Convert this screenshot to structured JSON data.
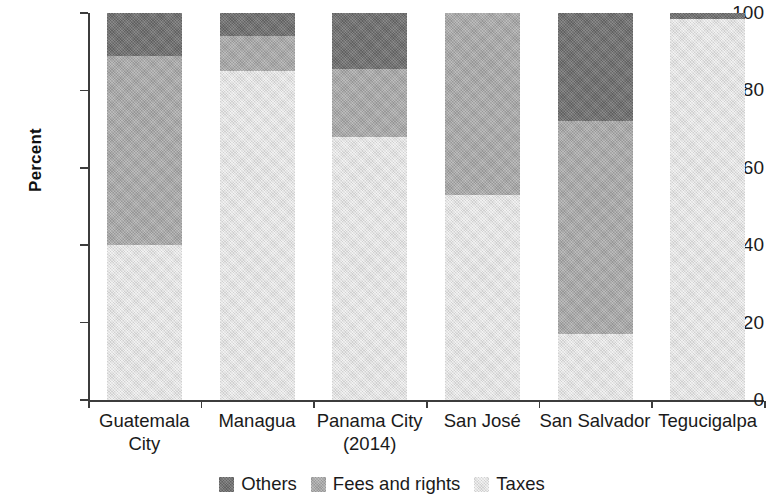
{
  "chart_data": {
    "type": "bar",
    "subtype": "stacked-bar-100-percent",
    "title": "",
    "xlabel": "",
    "ylabel": "Percent",
    "ylim": [
      0,
      100
    ],
    "yticks": [
      0,
      20,
      40,
      60,
      80,
      100
    ],
    "ytick_labels": [
      "0",
      "20",
      "40",
      "60",
      "80",
      "100"
    ],
    "grid": false,
    "legend_position": "bottom-center",
    "categories": [
      "Guatemala City",
      "Managua",
      "Panama City (2014)",
      "San José",
      "San Salvador",
      "Tegucigalpa"
    ],
    "category_lines": [
      [
        "Guatemala",
        "City"
      ],
      [
        "Managua",
        ""
      ],
      [
        "Panama City",
        "(2014)"
      ],
      [
        "San José",
        ""
      ],
      [
        "San Salvador",
        ""
      ],
      [
        "Tegucigalpa",
        ""
      ]
    ],
    "series": [
      {
        "name": "Taxes",
        "color": "#e2e2e2",
        "values": [
          40,
          85,
          68,
          53,
          17,
          98.5
        ]
      },
      {
        "name": "Fees and rights",
        "color": "#a8a8a8",
        "values": [
          49,
          9,
          17.5,
          47,
          55,
          0
        ]
      },
      {
        "name": "Others",
        "color": "#6e6e6e",
        "values": [
          11,
          6,
          14.5,
          0,
          28,
          1.5
        ]
      }
    ],
    "stack_order_bottom_to_top": [
      "Taxes",
      "Fees and rights",
      "Others"
    ],
    "legend": [
      {
        "label": "Others",
        "color": "#6e6e6e"
      },
      {
        "label": "Fees and rights",
        "color": "#a8a8a8"
      },
      {
        "label": "Taxes",
        "color": "#e2e2e2"
      }
    ]
  }
}
